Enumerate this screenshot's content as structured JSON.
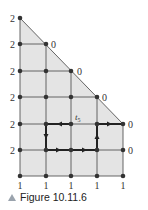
{
  "figure": {
    "caption": "Figure 10.11.6",
    "path_label": "t",
    "path_label_sub": "5",
    "left_labels": [
      "2",
      "2",
      "2",
      "2",
      "2",
      "2"
    ],
    "bottom_labels": [
      "1",
      "1",
      "1",
      "1",
      "1"
    ],
    "right_labels": [
      "0",
      "0",
      "0",
      "0",
      "0"
    ],
    "colors": {
      "fill": "#e4e4e4",
      "grid": "#555555",
      "node": "#333333",
      "path": "#222222",
      "caption_icon": "#9aa3ad"
    }
  }
}
